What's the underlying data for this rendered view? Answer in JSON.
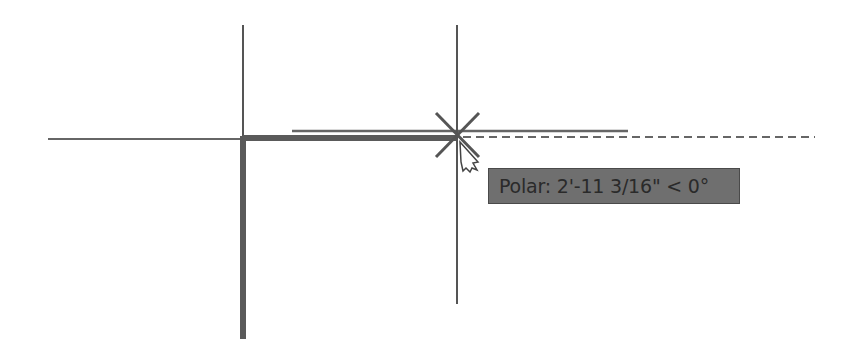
{
  "drawing": {
    "tooltip": {
      "label": "Polar: 2'-11 3/16\" < 0°"
    },
    "colors": {
      "background": "#ffffff",
      "line": "#555555",
      "thick_line": "#5a5a5a",
      "tooltip_bg": "#6f6f6f",
      "tooltip_text": "#2a2a2a"
    }
  }
}
